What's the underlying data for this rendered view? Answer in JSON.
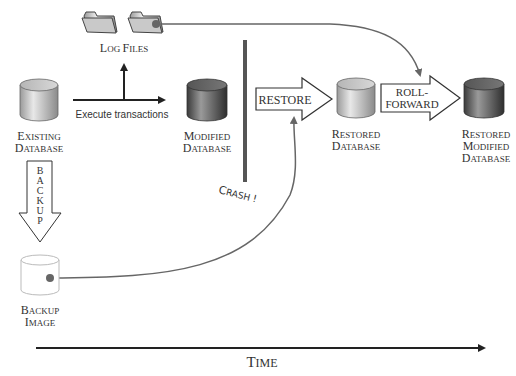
{
  "diagram": {
    "log_files": {
      "line1_cap": "L",
      "line1_rest": "OG ",
      "line2_cap": "F",
      "line2_rest": "ILES"
    },
    "existing_db": {
      "l1c": "E",
      "l1r": "XISTING",
      "l2c": "D",
      "l2r": "ATABASE"
    },
    "modified_db": {
      "l1c": "M",
      "l1r": "ODIFIED",
      "l2c": "D",
      "l2r": "ATABASE"
    },
    "restored_db": {
      "l1c": "R",
      "l1r": "ESTORED",
      "l2c": "D",
      "l2r": "ATABASE"
    },
    "restored_modified_db": {
      "l1c": "R",
      "l1r": "ESTORED",
      "l2c": "M",
      "l2r": "ODIFIED",
      "l3c": "D",
      "l3r": "ATABASE"
    },
    "backup_image": {
      "l1c": "B",
      "l1r": "ACKUP",
      "l2c": "I",
      "l2r": "MAGE"
    },
    "execute_label": "Execute transactions",
    "restore_label": "RESTORE",
    "rollforward_line1": "ROLL-",
    "rollforward_line2": "FORWARD",
    "backup_letters": [
      "B",
      "A",
      "C",
      "K",
      "U",
      "P"
    ],
    "crash_label": [
      "C",
      "R",
      "A",
      "S",
      "H",
      " ",
      "!"
    ],
    "time": {
      "cap": "T",
      "rest": "IME"
    },
    "colors": {
      "line": "#555555",
      "crash_bar": "#555555",
      "light_db": "#c8c8c8",
      "dark_db": "#5a5a5a",
      "connector": "#666666"
    }
  }
}
